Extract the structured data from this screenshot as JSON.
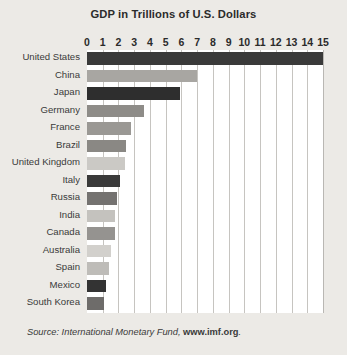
{
  "chart_data": {
    "type": "bar",
    "orientation": "horizontal",
    "title": "GDP in Trillions of U.S. Dollars",
    "xlabel": "",
    "ylabel": "",
    "xlim": [
      0,
      15
    ],
    "grid": true,
    "legend": false,
    "tick_labels": [
      "0",
      "1",
      "2",
      "3",
      "4",
      "5",
      "6",
      "7",
      "8",
      "9",
      "10",
      "11",
      "12",
      "13",
      "14",
      "15"
    ],
    "tick_values": [
      0,
      1,
      2,
      3,
      4,
      5,
      6,
      7,
      8,
      9,
      10,
      11,
      12,
      13,
      14,
      15
    ],
    "categories": [
      "United States",
      "China",
      "Japan",
      "Germany",
      "France",
      "Brazil",
      "United Kingdom",
      "Italy",
      "Russia",
      "India",
      "Canada",
      "Australia",
      "Spain",
      "Mexico",
      "South Korea"
    ],
    "values": [
      15.0,
      7.0,
      5.9,
      3.6,
      2.8,
      2.5,
      2.4,
      2.1,
      1.9,
      1.8,
      1.8,
      1.5,
      1.4,
      1.2,
      1.1
    ],
    "bar_colors": [
      "#3a3a3a",
      "#a8a6a2",
      "#2e2e2e",
      "#8e8c88",
      "#9a9894",
      "#8a8884",
      "#cbc9c5",
      "#3a3a3a",
      "#747270",
      "#c4c2be",
      "#959390",
      "#d2d0cc",
      "#bebcb8",
      "#333333",
      "#6e6c6a"
    ]
  },
  "source": {
    "prefix": "Source: International Monetary Fund, ",
    "link_text": "www.imf.org",
    "suffix": "."
  },
  "colors": {
    "background": "#eceae6",
    "plot_background": "#ffffff",
    "gridline": "#c6c4c0",
    "text": "#2b2b2b"
  }
}
